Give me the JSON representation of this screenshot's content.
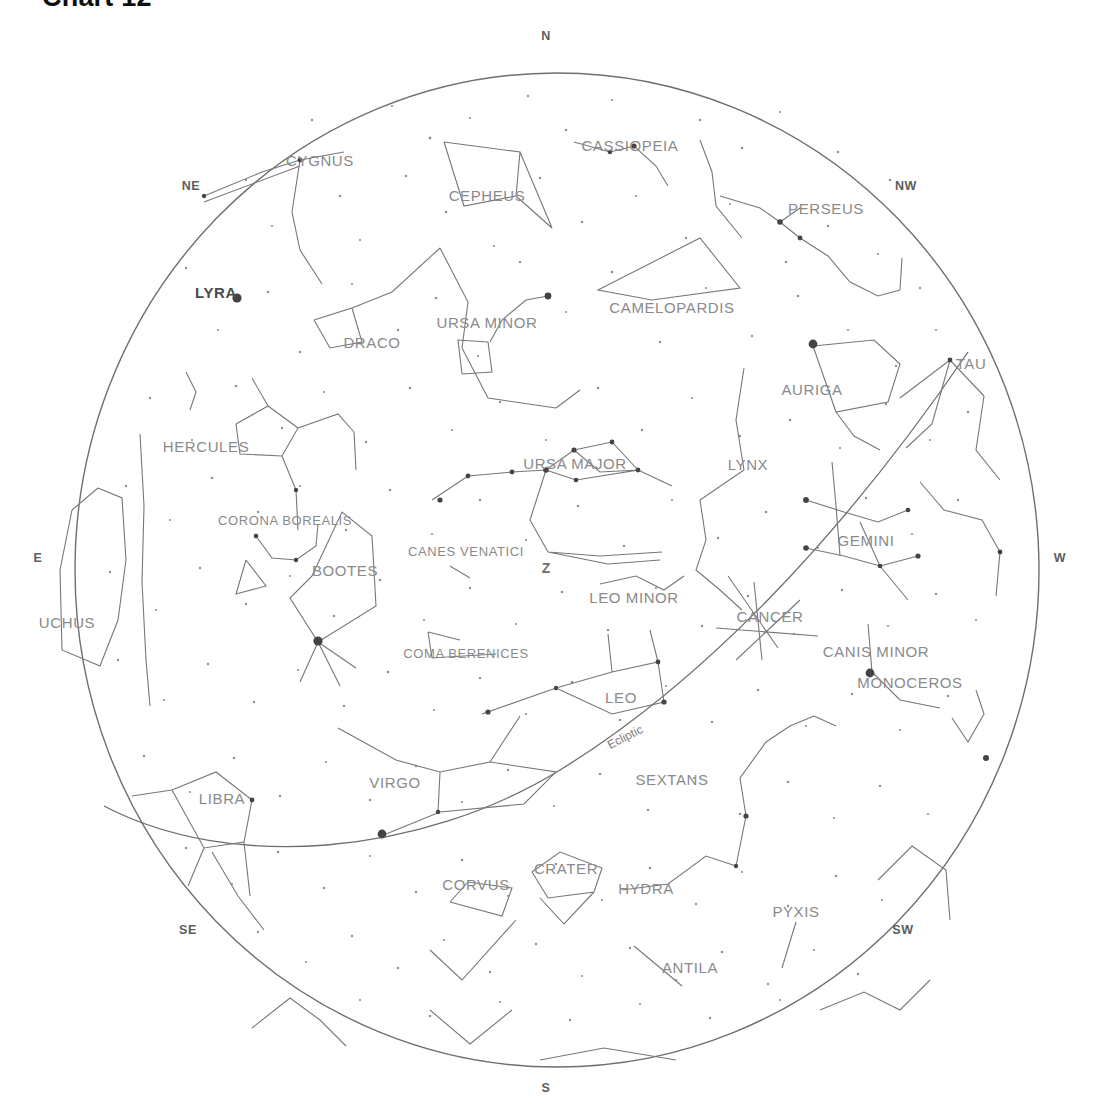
{
  "title": "Chart 12",
  "colors": {
    "background": "#ffffff",
    "horizon_circle": "#6f6f6f",
    "constellation_line": "#777777",
    "star": "#555555",
    "label_text": "#8a8a8a",
    "compass_text": "#5d5d5d",
    "title_text": "#0d0d0d",
    "ecliptic": "#6d6d6d"
  },
  "horizon": {
    "label": "horizon-circle",
    "cx": 557,
    "cy": 570,
    "rx": 482,
    "ry": 497
  },
  "compass": [
    {
      "id": "n",
      "label": "N",
      "x": 546,
      "y": 36
    },
    {
      "id": "ne",
      "label": "NE",
      "x": 191,
      "y": 186
    },
    {
      "id": "nw",
      "label": "NW",
      "x": 906,
      "y": 186
    },
    {
      "id": "e",
      "label": "E",
      "x": 38,
      "y": 558
    },
    {
      "id": "w",
      "label": "W",
      "x": 1060,
      "y": 558
    },
    {
      "id": "se",
      "label": "SE",
      "x": 188,
      "y": 930
    },
    {
      "id": "sw",
      "label": "SW",
      "x": 903,
      "y": 930
    },
    {
      "id": "s",
      "label": "S",
      "x": 546,
      "y": 1088
    }
  ],
  "zenith": {
    "label": "Z",
    "x": 546,
    "y": 568
  },
  "ecliptic": {
    "label": "Ecliptic",
    "x": 625,
    "y": 737,
    "rotation": -27
  },
  "constellations": [
    {
      "id": "cygnus",
      "label": "CYGNUS",
      "x": 320,
      "y": 160,
      "style": "plain"
    },
    {
      "id": "cepheus",
      "label": "CEPHEUS",
      "x": 487,
      "y": 195,
      "style": "plain"
    },
    {
      "id": "cassiopeia",
      "label": "CASSIOPEIA",
      "x": 630,
      "y": 145,
      "style": "plain"
    },
    {
      "id": "perseus",
      "label": "PERSEUS",
      "x": 826,
      "y": 208,
      "style": "plain"
    },
    {
      "id": "camelopardis",
      "label": "CAMELOPARDIS",
      "x": 672,
      "y": 307,
      "style": "plain"
    },
    {
      "id": "lyra",
      "label": "LYRA",
      "x": 216,
      "y": 292,
      "style": "dark"
    },
    {
      "id": "draco",
      "label": "DRACO",
      "x": 372,
      "y": 342,
      "style": "plain"
    },
    {
      "id": "ursa_minor",
      "label": "URSA MINOR",
      "x": 487,
      "y": 322,
      "style": "plain"
    },
    {
      "id": "auriga",
      "label": "AURIGA",
      "x": 812,
      "y": 389,
      "style": "plain"
    },
    {
      "id": "taurus",
      "label": "TAU",
      "x": 971,
      "y": 363,
      "style": "plain"
    },
    {
      "id": "hercules",
      "label": "HERCULES",
      "x": 206,
      "y": 446,
      "style": "plain"
    },
    {
      "id": "ursa_major",
      "label": "URSA MAJOR",
      "x": 575,
      "y": 463,
      "style": "plain"
    },
    {
      "id": "lynx",
      "label": "LYNX",
      "x": 748,
      "y": 464,
      "style": "plain"
    },
    {
      "id": "corona_borealis",
      "label": "CORONA BOREALIS",
      "x": 285,
      "y": 520,
      "style": "plain"
    },
    {
      "id": "gemini",
      "label": "GEMINI",
      "x": 866,
      "y": 540,
      "style": "plain"
    },
    {
      "id": "canes_venatici",
      "label": "CANES VENATICI",
      "x": 466,
      "y": 551,
      "style": "plain"
    },
    {
      "id": "bootes",
      "label": "BOOTES",
      "x": 345,
      "y": 570,
      "style": "plain"
    },
    {
      "id": "leo_minor",
      "label": "LEO MINOR",
      "x": 634,
      "y": 597,
      "style": "plain"
    },
    {
      "id": "cancer",
      "label": "CANCER",
      "x": 770,
      "y": 616,
      "style": "plain"
    },
    {
      "id": "ophiuchus",
      "label": "UCHUS",
      "x": 67,
      "y": 622,
      "style": "plain"
    },
    {
      "id": "canis_minor",
      "label": "CANIS MINOR",
      "x": 876,
      "y": 651,
      "style": "plain"
    },
    {
      "id": "coma_berenices",
      "label": "COMA BERENICES",
      "x": 466,
      "y": 653,
      "style": "plain"
    },
    {
      "id": "monoceros",
      "label": "MONOCEROS",
      "x": 910,
      "y": 682,
      "style": "plain"
    },
    {
      "id": "leo",
      "label": "LEO",
      "x": 621,
      "y": 697,
      "style": "plain"
    },
    {
      "id": "virgo",
      "label": "VIRGO",
      "x": 395,
      "y": 782,
      "style": "plain"
    },
    {
      "id": "sextans",
      "label": "SEXTANS",
      "x": 672,
      "y": 779,
      "style": "plain"
    },
    {
      "id": "libra",
      "label": "LIBRA",
      "x": 222,
      "y": 798,
      "style": "plain"
    },
    {
      "id": "crater",
      "label": "CRATER",
      "x": 566,
      "y": 868,
      "style": "plain"
    },
    {
      "id": "corvus",
      "label": "CORVUS",
      "x": 476,
      "y": 884,
      "style": "plain"
    },
    {
      "id": "hydra",
      "label": "HYDRA",
      "x": 646,
      "y": 888,
      "style": "plain"
    },
    {
      "id": "pyxis",
      "label": "PYXIS",
      "x": 796,
      "y": 911,
      "style": "plain"
    },
    {
      "id": "antila",
      "label": "ANTILA",
      "x": 690,
      "y": 967,
      "style": "plain"
    }
  ],
  "chart_data": {
    "type": "scatter",
    "title": "Chart 12",
    "subtitle": "All-sky star chart, horizon projection",
    "xlabel": "",
    "ylabel": "",
    "grid": false,
    "legend": "none",
    "projection": "stereographic all-sky (zenith at center)",
    "horizon_markers": [
      "N",
      "NE",
      "E",
      "SE",
      "S",
      "SW",
      "W",
      "NW"
    ],
    "zenith_marker": "Z",
    "reference_curve": "Ecliptic",
    "constellation_count": 32,
    "constellations_listed": [
      "CYGNUS",
      "CEPHEUS",
      "CASSIOPEIA",
      "PERSEUS",
      "CAMELOPARDIS",
      "LYRA",
      "DRACO",
      "URSA MINOR",
      "AURIGA",
      "TAU",
      "HERCULES",
      "URSA MAJOR",
      "LYNX",
      "CORONA BOREALIS",
      "GEMINI",
      "CANES VENATICI",
      "BOOTES",
      "LEO MINOR",
      "CANCER",
      "UCHUS",
      "CANIS MINOR",
      "COMA BERENICES",
      "MONOCEROS",
      "LEO",
      "VIRGO",
      "SEXTANS",
      "LIBRA",
      "CRATER",
      "CORVUS",
      "HYDRA",
      "PYXIS",
      "ANTILA"
    ],
    "asterism_polylines": {
      "ursa_major": [
        [
          437,
          497
        ],
        [
          468,
          474
        ],
        [
          512,
          471
        ],
        [
          545,
          470
        ],
        [
          572,
          452
        ],
        [
          612,
          442
        ],
        [
          637,
          468
        ],
        [
          577,
          478
        ],
        [
          545,
          470
        ]
      ],
      "ursa_minor": [
        [
          465,
          372
        ],
        [
          460,
          338
        ],
        [
          487,
          340
        ],
        [
          490,
          370
        ],
        [
          465,
          372
        ],
        [
          500,
          320
        ],
        [
          525,
          300
        ],
        [
          549,
          296
        ]
      ],
      "cassiopeia": [
        [
          584,
          144
        ],
        [
          608,
          158
        ],
        [
          630,
          150
        ],
        [
          652,
          163
        ],
        [
          668,
          183
        ]
      ],
      "cepheus": [
        [
          455,
          142
        ],
        [
          520,
          154
        ],
        [
          513,
          196
        ],
        [
          462,
          206
        ],
        [
          455,
          142
        ],
        [
          520,
          154
        ],
        [
          553,
          226
        ],
        [
          513,
          196
        ]
      ],
      "cygnus": [
        [
          222,
          205
        ],
        [
          288,
          169
        ],
        [
          330,
          157
        ],
        [
          292,
          212
        ],
        [
          300,
          250
        ],
        [
          320,
          278
        ]
      ],
      "draco": [
        [
          310,
          318
        ],
        [
          328,
          345
        ],
        [
          358,
          340
        ],
        [
          350,
          310
        ],
        [
          310,
          318
        ],
        [
          390,
          290
        ],
        [
          443,
          247
        ],
        [
          470,
          300
        ],
        [
          462,
          345
        ],
        [
          488,
          400
        ],
        [
          560,
          410
        ]
      ],
      "leo": [
        [
          488,
          712
        ],
        [
          560,
          685
        ],
        [
          610,
          670
        ],
        [
          655,
          662
        ],
        [
          662,
          700
        ],
        [
          610,
          712
        ],
        [
          560,
          685
        ]
      ],
      "virgo": [
        [
          336,
          732
        ],
        [
          396,
          760
        ],
        [
          437,
          772
        ],
        [
          490,
          760
        ],
        [
          520,
          720
        ],
        [
          556,
          770
        ],
        [
          520,
          800
        ],
        [
          440,
          810
        ],
        [
          386,
          833
        ]
      ],
      "gemini": [
        [
          808,
          500
        ],
        [
          840,
          510
        ],
        [
          874,
          524
        ],
        [
          906,
          512
        ],
        [
          830,
          548
        ],
        [
          862,
          556
        ],
        [
          898,
          566
        ],
        [
          920,
          556
        ]
      ],
      "auriga": [
        [
          812,
          345
        ],
        [
          872,
          340
        ],
        [
          900,
          362
        ],
        [
          890,
          400
        ],
        [
          838,
          410
        ],
        [
          812,
          345
        ]
      ],
      "corvus": [
        [
          452,
          900
        ],
        [
          470,
          880
        ],
        [
          512,
          886
        ],
        [
          500,
          912
        ],
        [
          452,
          900
        ]
      ],
      "crater": [
        [
          528,
          872
        ],
        [
          560,
          852
        ],
        [
          600,
          866
        ],
        [
          592,
          890
        ],
        [
          548,
          894
        ],
        [
          528,
          872
        ]
      ],
      "hydra": [
        [
          560,
          880
        ],
        [
          612,
          874
        ],
        [
          660,
          852
        ],
        [
          700,
          860
        ],
        [
          730,
          800
        ],
        [
          740,
          760
        ],
        [
          770,
          740
        ],
        [
          800,
          724
        ]
      ],
      "bootes": [
        [
          310,
          570
        ],
        [
          340,
          518
        ],
        [
          370,
          538
        ],
        [
          375,
          605
        ],
        [
          340,
          642
        ],
        [
          300,
          600
        ],
        [
          310,
          570
        ]
      ],
      "corona_borealis": [
        [
          262,
          540
        ],
        [
          280,
          556
        ],
        [
          302,
          552
        ],
        [
          316,
          538
        ],
        [
          312,
          520
        ]
      ],
      "hercules": [
        [
          235,
          425
        ],
        [
          265,
          408
        ],
        [
          295,
          428
        ],
        [
          280,
          455
        ],
        [
          240,
          452
        ],
        [
          235,
          425
        ]
      ]
    },
    "bright_stars": [
      {
        "name": "Vega",
        "x": 237,
        "y": 298,
        "magnitude_rank": 1
      },
      {
        "name": "Capella",
        "x": 813,
        "y": 344,
        "magnitude_rank": 1
      },
      {
        "name": "Arcturus",
        "x": 318,
        "y": 641,
        "magnitude_rank": 1
      },
      {
        "name": "Procyon",
        "x": 870,
        "y": 673,
        "magnitude_rank": 1
      },
      {
        "name": "Spica",
        "x": 382,
        "y": 834,
        "magnitude_rank": 1
      },
      {
        "name": "Polaris",
        "x": 548,
        "y": 296,
        "magnitude_rank": 2
      }
    ]
  }
}
